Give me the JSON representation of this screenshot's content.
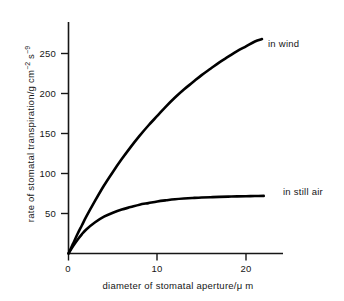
{
  "chart_data": {
    "type": "line",
    "title": "",
    "xlabel": "diameter of stomatal aperture/μ m",
    "ylabel_plain": "rate of stomatal transpiration/g cm⁻² s⁻⁹",
    "ylabel_parts": {
      "main": "rate of stomatal transpiration/g cm",
      "sup1": "−2",
      "mid": " s",
      "sup2": "−9"
    },
    "xlim": [
      0,
      24.2
    ],
    "ylim": [
      0,
      290
    ],
    "xticks": [
      0,
      10,
      20
    ],
    "xtick_labels": [
      "0",
      "10",
      "20"
    ],
    "yticks": [
      50,
      100,
      150,
      200,
      250
    ],
    "ytick_labels": [
      "50",
      "100",
      "150",
      "200",
      "250"
    ],
    "grid": false,
    "legend_position": "inline-right-of-curve",
    "axis_color": "#161616",
    "curve_color": "#000000",
    "background": "#ffffff",
    "series": [
      {
        "name": "in wind",
        "label": "in wind",
        "x": [
          0,
          0.5,
          1,
          1.5,
          2,
          3,
          4,
          5,
          6,
          7,
          8,
          9,
          10,
          11,
          12,
          13,
          14,
          15,
          16,
          17,
          18,
          19,
          20,
          21,
          21.8
        ],
        "values": [
          0,
          12,
          24,
          35,
          46,
          66,
          85,
          102,
          118,
          133,
          147,
          160,
          172,
          184,
          195,
          205,
          214,
          223,
          231,
          239,
          246,
          253,
          259,
          265,
          268
        ]
      },
      {
        "name": "in still air",
        "label": "in still air",
        "x": [
          0,
          0.5,
          1,
          1.5,
          2,
          3,
          4,
          5,
          6,
          7,
          8,
          9,
          10,
          11,
          12,
          13,
          14,
          15,
          16,
          17,
          18,
          19,
          20,
          21,
          22
        ],
        "values": [
          0,
          9,
          17,
          24,
          30,
          39,
          46,
          51,
          55,
          58,
          61,
          63,
          65,
          66.5,
          67.8,
          68.7,
          69.4,
          70,
          70.4,
          70.8,
          71.1,
          71.4,
          71.6,
          71.8,
          72
        ]
      }
    ]
  }
}
